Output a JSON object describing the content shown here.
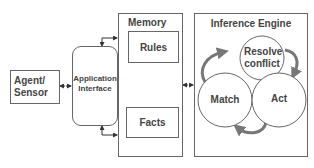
{
  "diagram": {
    "agent_sensor": {
      "label": "Agent/ Sensor"
    },
    "application_interface": {
      "label": "Application Interface"
    },
    "memory": {
      "title": "Memory",
      "rules": "Rules",
      "facts": "Facts"
    },
    "inference_engine": {
      "title": "Inference Engine",
      "cycle": [
        "Resolve conflict",
        "Act",
        "Match"
      ]
    },
    "colors": {
      "border": "#666666",
      "text": "#444444",
      "cycle_arrow": "#777777"
    }
  }
}
